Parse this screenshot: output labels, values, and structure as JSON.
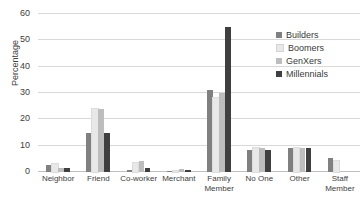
{
  "chart_data": {
    "type": "bar",
    "title": "",
    "xlabel": "",
    "ylabel": "Percentage",
    "ylim": [
      0,
      60
    ],
    "ytick_step": 10,
    "yticks": [
      0,
      10,
      20,
      30,
      40,
      50,
      60
    ],
    "grid": true,
    "legend_position": "inside-top-right",
    "categories": [
      "Neighbor",
      "Friend",
      "Co-worker",
      "Merchant",
      "Family Member",
      "No One",
      "Other",
      "Staff Member"
    ],
    "series": [
      {
        "name": "Builders",
        "color": "#808080",
        "values": [
          2.5,
          15,
          0.6,
          0.4,
          31,
          8.5,
          9,
          5.5
        ]
      },
      {
        "name": "Boomers",
        "color": "#e8e8e8",
        "values": [
          3.2,
          24,
          3.5,
          0.5,
          28,
          9,
          9,
          4
        ]
      },
      {
        "name": "GenXers",
        "color": "#bdbdbd",
        "values": [
          1.6,
          24,
          4,
          1.0,
          30,
          9,
          9,
          0
        ]
      },
      {
        "name": "Millennials",
        "color": "#3f3f3f",
        "values": [
          1.5,
          15,
          1.5,
          0.6,
          55,
          8.5,
          9,
          0
        ]
      }
    ]
  },
  "axis": {
    "y_title": "Percentage",
    "y_tick_labels": [
      "60",
      "50",
      "40",
      "30",
      "20",
      "10",
      "0"
    ]
  },
  "legend": {
    "items": [
      {
        "label": "Builders",
        "color": "#808080"
      },
      {
        "label": "Boomers",
        "color": "#e8e8e8"
      },
      {
        "label": "GenXers",
        "color": "#bdbdbd"
      },
      {
        "label": "Millennials",
        "color": "#3f3f3f"
      }
    ]
  }
}
